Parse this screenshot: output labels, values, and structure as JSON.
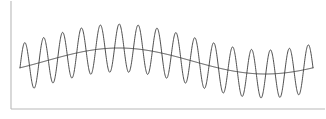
{
  "chart_data": {
    "type": "line",
    "title": "",
    "subtitle": "",
    "xlabel": "",
    "ylabel": "",
    "xlim": [
      0,
      326
    ],
    "ylim": [
      0,
      119
    ],
    "grid": false,
    "legend": null,
    "legend_position": "none",
    "tick_labels_x": [],
    "tick_labels_y": [],
    "annotations": [],
    "axes": {
      "style": "L-shaped",
      "color": "#b9b9b9",
      "stroke_width": 1.1,
      "y_axis_x": 11,
      "y_axis_top": 1,
      "y_axis_bottom": 109,
      "x_axis_y": 109,
      "x_axis_left": 11,
      "x_axis_right": 325
    },
    "series": [
      {
        "name": "envelope-carrier",
        "role": "slow modulating centerline",
        "color": "#454545",
        "stroke_width": 0.95,
        "x_start": 20,
        "x_end": 313,
        "form": "sine",
        "baseline_y": 61,
        "amplitude_y": 13,
        "cycles": 1.0,
        "phase_deg": 0,
        "peak_x": 150,
        "peak_y": 48,
        "trough_x": 256,
        "trough_y": 72,
        "sample_points_xy": [
          [
            20,
            64
          ],
          [
            40,
            62
          ],
          [
            60,
            58
          ],
          [
            80,
            54
          ],
          [
            100,
            51
          ],
          [
            120,
            49
          ],
          [
            140,
            48
          ],
          [
            160,
            48
          ],
          [
            180,
            50
          ],
          [
            200,
            54
          ],
          [
            220,
            59
          ],
          [
            240,
            65
          ],
          [
            260,
            70
          ],
          [
            280,
            70
          ],
          [
            300,
            62
          ],
          [
            313,
            55
          ]
        ]
      },
      {
        "name": "oscillation",
        "role": "high-frequency modulated signal",
        "color": "#3a3a3a",
        "stroke_width": 0.9,
        "x_start": 20,
        "x_end": 313,
        "form": "sine",
        "cycles": 15.5,
        "amplitude_y": 24,
        "phase_deg": 0,
        "max_peak_y": 20,
        "min_trough_y": 93,
        "peak_count": 16
      }
    ]
  },
  "chart": {
    "width": 326,
    "height": 119,
    "background": "#ffffff"
  }
}
